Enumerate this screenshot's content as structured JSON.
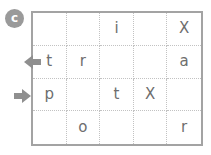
{
  "badge": {
    "label": "c"
  },
  "grid": {
    "rows": 4,
    "cols": 5,
    "cells": [
      [
        "",
        "",
        "i",
        "",
        "X"
      ],
      [
        "t",
        "r",
        "",
        "",
        "a"
      ],
      [
        "p",
        "",
        "t",
        "X",
        ""
      ],
      [
        "",
        "o",
        "",
        "",
        "r"
      ]
    ]
  },
  "arrows": {
    "left": {
      "glyph": "◀",
      "row": 2,
      "direction": "left"
    },
    "right": {
      "glyph": "▶",
      "row": 3,
      "direction": "right"
    }
  },
  "colors": {
    "badge_bg": "#9a9a9a",
    "badge_fg": "#ffffff",
    "grid_border": "#a3a3a3",
    "grid_inner_line": "#c2c2c2",
    "cell_text": "#6e6e6e",
    "arrow": "#8f8f8f",
    "background": "#ffffff"
  }
}
